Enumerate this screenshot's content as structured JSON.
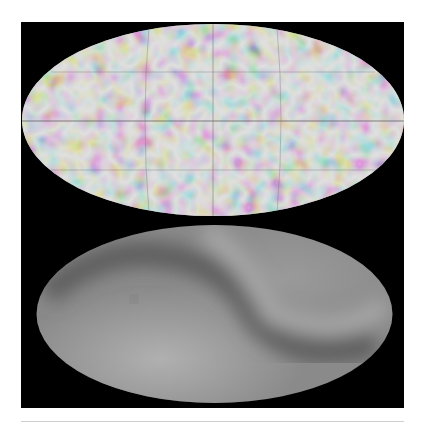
{
  "figure": {
    "panels": [
      {
        "name": "top-map",
        "projection": "mollweide",
        "description": "full-sky map with mottled small-scale fluctuations and graticule lines",
        "colors": {
          "base": "#9a9a9a",
          "dark": "#4a4a4a",
          "light": "#c4c4c4"
        }
      },
      {
        "name": "bottom-map",
        "projection": "mollweide",
        "description": "smooth large-scale full-sky map with S-shaped band",
        "colors": {
          "base": "#8c8c8c",
          "dark": "#5a5a5a",
          "light": "#b8b8b8"
        }
      }
    ],
    "background": "#000000"
  }
}
